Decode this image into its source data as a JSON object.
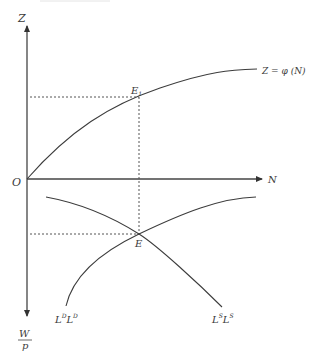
{
  "diagram": {
    "title": "",
    "top_axis_label": "Z",
    "bottom_axis_label_numerator": "W",
    "bottom_axis_label_denominator": "p",
    "horizontal_axis_label": "N",
    "origin_label": "O",
    "upper_equilibrium": {
      "label": "E",
      "subscript": "1"
    },
    "lower_equilibrium": {
      "label": "E"
    },
    "production_function": {
      "label": "Z = φ (N)"
    },
    "demand_curve": {
      "label_base": "L",
      "label_sup": "D",
      "label_base2": "L",
      "label_sup2": "D"
    },
    "supply_curve": {
      "label_base": "L",
      "label_sup": "S",
      "label_base2": "L",
      "label_sup2": "S"
    },
    "colors": {
      "line": "#3c3c3c",
      "text": "#3a3a3a",
      "background": "#ffffff"
    }
  }
}
